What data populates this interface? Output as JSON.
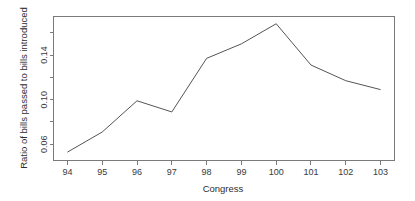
{
  "chart_data": {
    "type": "line",
    "title": "",
    "xlabel": "Congress",
    "ylabel": "Ratio of bills passed to bills introduced",
    "categories": [
      "94",
      "95",
      "96",
      "97",
      "98",
      "99",
      "100",
      "101",
      "102",
      "103"
    ],
    "x": [
      94,
      95,
      96,
      97,
      98,
      99,
      100,
      101,
      102,
      103
    ],
    "values": [
      0.053,
      0.071,
      0.099,
      0.089,
      0.137,
      0.15,
      0.168,
      0.131,
      0.117,
      0.109
    ],
    "series": [
      {
        "name": "Ratio of bills passed to bills introduced",
        "values": [
          0.053,
          0.071,
          0.099,
          0.089,
          0.137,
          0.15,
          0.168,
          0.131,
          0.117,
          0.109
        ]
      }
    ],
    "xlim": [
      93.6,
      103.4
    ],
    "ylim": [
      0.0455,
      0.1745
    ],
    "xticks": [
      94,
      95,
      96,
      97,
      98,
      99,
      100,
      101,
      102,
      103
    ],
    "xtick_labels": [
      "94",
      "95",
      "96",
      "97",
      "98",
      "99",
      "100",
      "101",
      "102",
      "103"
    ],
    "yticks": [
      0.06,
      0.1,
      0.14
    ],
    "ytick_labels": [
      "0.06",
      "0.10",
      "0.14"
    ],
    "yticks_minor": [
      0.08,
      0.12,
      0.16
    ],
    "grid": false,
    "legend": null,
    "legend_position": "none",
    "line_color": "#555555",
    "axis_color": "#7a7a7a",
    "background_color": "#ffffff",
    "annotations": []
  },
  "axes": {
    "x_title": "Congress",
    "y_title": "Ratio of bills passed to bills introduced"
  }
}
